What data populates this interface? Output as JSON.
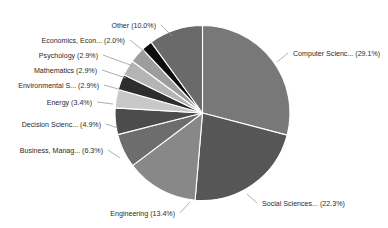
{
  "chart_data": {
    "type": "pie",
    "title": "",
    "subtitle": "",
    "xlabel": "",
    "ylabel": "",
    "legend_position": "none",
    "grid": false,
    "label_format": "{name} ({value}%)",
    "start_angle_deg": 0,
    "direction": "clockwise",
    "categories": [
      "Computer Scienc...",
      "Social Sciences...",
      "Engineering",
      "Business, Manag...",
      "Decision Scienc...",
      "Energy",
      "Environmental S...",
      "Mathematics",
      "Psychology",
      "Economics, Econ...",
      "Other"
    ],
    "values": [
      29.1,
      22.3,
      13.4,
      6.3,
      4.9,
      3.4,
      2.9,
      2.9,
      2.9,
      2.0,
      10.0
    ],
    "colors": [
      "#787878",
      "#565656",
      "#888888",
      "#6d6d6d",
      "#4c4c4c",
      "#c8c8c8",
      "#2e2e2e",
      "#b4b4b4",
      "#9d9d9d",
      "#0d0d0d",
      "#6a6a6a"
    ],
    "slices": [
      {
        "name": "Computer Scienc...",
        "value": 29.1,
        "label": "Computer Scienc... (29.1%)",
        "color": "#787878"
      },
      {
        "name": "Social Sciences...",
        "value": 22.3,
        "label": "Social Sciences... (22.3%)",
        "color": "#565656"
      },
      {
        "name": "Engineering",
        "value": 13.4,
        "label": "Engineering (13.4%)",
        "color": "#888888"
      },
      {
        "name": "Business, Manag...",
        "value": 6.3,
        "label": "Business, Manag... (6.3%)",
        "color": "#6d6d6d"
      },
      {
        "name": "Decision Scienc...",
        "value": 4.9,
        "label": "Decision Scienc... (4.9%)",
        "color": "#4c4c4c"
      },
      {
        "name": "Energy",
        "value": 3.4,
        "label": "Energy (3.4%)",
        "color": "#c8c8c8"
      },
      {
        "name": "Environmental S...",
        "value": 2.9,
        "label": "Environmental S... (2.9%)",
        "color": "#2e2e2e"
      },
      {
        "name": "Mathematics",
        "value": 2.9,
        "label": "Mathematics (2.9%)",
        "color": "#b4b4b4"
      },
      {
        "name": "Psychology",
        "value": 2.9,
        "label": "Psychology (2.9%)",
        "color": "#9d9d9d"
      },
      {
        "name": "Economics, Econ...",
        "value": 2.0,
        "label": "Economics, Econ... (2.0%)",
        "color": "#0d0d0d"
      },
      {
        "name": "Other",
        "value": 10.0,
        "label": "Other (10.0%)",
        "color": "#6a6a6a"
      }
    ],
    "total": 100.1,
    "units": "%"
  },
  "figure": {
    "background": "#ffffff",
    "text_color": "#2b2b2b",
    "leader_color": "#9a9a9a",
    "slice_border": "#ffffff"
  }
}
